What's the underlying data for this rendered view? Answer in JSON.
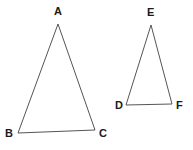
{
  "figure": {
    "background_color": "#ffffff",
    "stroke_color": "#555555",
    "label_color": "#1a1a1a",
    "stroke_width": 1,
    "width": 193,
    "height": 150
  },
  "shapes": [
    {
      "name": "triangle-abc",
      "type": "triangle",
      "vertices": [
        {
          "label": "A",
          "x": 58,
          "y": 24
        },
        {
          "label": "B",
          "x": 18,
          "y": 133
        },
        {
          "label": "C",
          "x": 95,
          "y": 130
        }
      ],
      "points_attr": "58,24 18,133 95,130"
    },
    {
      "name": "triangle-def",
      "type": "triangle",
      "vertices": [
        {
          "label": "E",
          "x": 151,
          "y": 25
        },
        {
          "label": "D",
          "x": 126,
          "y": 105
        },
        {
          "label": "F",
          "x": 172,
          "y": 104
        }
      ],
      "points_attr": "151,25 126,105 172,104"
    }
  ],
  "labels": {
    "a": "A",
    "b": "B",
    "c": "C",
    "d": "D",
    "e": "E",
    "f": "F"
  }
}
